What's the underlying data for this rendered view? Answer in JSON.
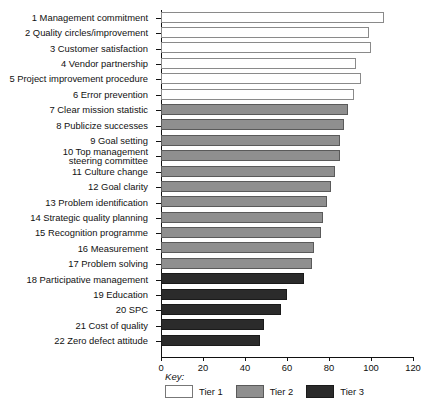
{
  "chart_data": {
    "type": "bar",
    "orientation": "horizontal",
    "title": "",
    "xlabel": "",
    "ylabel": "",
    "xlim": [
      0,
      120
    ],
    "xticks": [
      0,
      20,
      40,
      60,
      80,
      100,
      120
    ],
    "grid": false,
    "categories": [
      "1 Management commitment",
      "2 Quality circles/improvement",
      "3 Customer satisfaction",
      "4 Vendor partnership",
      "5 Project improvement procedure",
      "6 Error prevention",
      "7 Clear mission statistic",
      "8 Publicize successes",
      "9 Goal setting",
      "10 Top management steering committee",
      "11 Culture change",
      "12 Goal clarity",
      "13 Problem identification",
      "14 Strategic quality planning",
      "15 Recognition programme",
      "16 Measurement",
      "17 Problem solving",
      "18 Participative management",
      "19 Education",
      "20 SPC",
      "21 Cost of quality",
      "22 Zero defect attitude"
    ],
    "values": [
      106,
      99,
      100,
      93,
      95,
      92,
      89,
      87,
      85,
      85,
      83,
      81,
      79,
      77,
      76,
      73,
      72,
      68,
      60,
      57,
      49,
      47
    ],
    "series": [
      {
        "name": "Tier 1",
        "color": "#ffffff",
        "items": [
          {
            "label": "1 Management commitment",
            "value": 106
          },
          {
            "label": "2 Quality circles/improvement",
            "value": 99
          },
          {
            "label": "3 Customer satisfaction",
            "value": 100
          },
          {
            "label": "4 Vendor partnership",
            "value": 93
          },
          {
            "label": "5 Project improvement procedure",
            "value": 95
          },
          {
            "label": "6 Error prevention",
            "value": 92
          }
        ]
      },
      {
        "name": "Tier 2",
        "color": "#8f8f8f",
        "items": [
          {
            "label": "7 Clear mission statistic",
            "value": 89
          },
          {
            "label": "8 Publicize successes",
            "value": 87
          },
          {
            "label": "9 Goal setting",
            "value": 85
          },
          {
            "label": "10 Top management steering committee",
            "value": 85
          },
          {
            "label": "11 Culture change",
            "value": 83
          },
          {
            "label": "12 Goal clarity",
            "value": 81
          },
          {
            "label": "13 Problem identification",
            "value": 79
          },
          {
            "label": "14 Strategic quality planning",
            "value": 77
          },
          {
            "label": "15 Recognition programme",
            "value": 76
          },
          {
            "label": "16 Measurement",
            "value": 73
          },
          {
            "label": "17 Problem solving",
            "value": 72
          }
        ]
      },
      {
        "name": "Tier 3",
        "color": "#2b2b2b",
        "items": [
          {
            "label": "18 Participative management",
            "value": 68
          },
          {
            "label": "19 Education",
            "value": 60
          },
          {
            "label": "20 SPC",
            "value": 57
          },
          {
            "label": "21 Cost of quality",
            "value": 49
          },
          {
            "label": "22 Zero defect attitude",
            "value": 47
          }
        ]
      }
    ]
  },
  "bars": [
    {
      "label": "1 Management commitment",
      "label_line1": "1 Management commitment",
      "label_line2": "",
      "value": 106,
      "tier": "t1"
    },
    {
      "label": "2 Quality circles/improvement",
      "label_line1": "2 Quality circles/improvement",
      "label_line2": "",
      "value": 99,
      "tier": "t1"
    },
    {
      "label": "3 Customer satisfaction",
      "label_line1": "3 Customer satisfaction",
      "label_line2": "",
      "value": 100,
      "tier": "t1"
    },
    {
      "label": "4 Vendor partnership",
      "label_line1": "4 Vendor partnership",
      "label_line2": "",
      "value": 93,
      "tier": "t1"
    },
    {
      "label": "5 Project improvement procedure",
      "label_line1": "5 Project improvement procedure",
      "label_line2": "",
      "value": 95,
      "tier": "t1"
    },
    {
      "label": "6 Error prevention",
      "label_line1": "6 Error prevention",
      "label_line2": "",
      "value": 92,
      "tier": "t1"
    },
    {
      "label": "7 Clear mission statistic",
      "label_line1": "7 Clear mission statistic",
      "label_line2": "",
      "value": 89,
      "tier": "t2"
    },
    {
      "label": "8 Publicize successes",
      "label_line1": "8 Publicize successes",
      "label_line2": "",
      "value": 87,
      "tier": "t2"
    },
    {
      "label": "9 Goal setting",
      "label_line1": "9 Goal setting",
      "label_line2": "",
      "value": 85,
      "tier": "t2"
    },
    {
      "label": "10 Top management steering committee",
      "label_line1": "10 Top management",
      "label_line2": "steering committee",
      "value": 85,
      "tier": "t2"
    },
    {
      "label": "11 Culture change",
      "label_line1": "11 Culture change",
      "label_line2": "",
      "value": 83,
      "tier": "t2"
    },
    {
      "label": "12 Goal clarity",
      "label_line1": "12 Goal clarity",
      "label_line2": "",
      "value": 81,
      "tier": "t2"
    },
    {
      "label": "13 Problem identification",
      "label_line1": "13 Problem identification",
      "label_line2": "",
      "value": 79,
      "tier": "t2"
    },
    {
      "label": "14 Strategic quality planning",
      "label_line1": "14 Strategic quality planning",
      "label_line2": "",
      "value": 77,
      "tier": "t2"
    },
    {
      "label": "15 Recognition programme",
      "label_line1": "15 Recognition programme",
      "label_line2": "",
      "value": 76,
      "tier": "t2"
    },
    {
      "label": "16 Measurement",
      "label_line1": "16 Measurement",
      "label_line2": "",
      "value": 73,
      "tier": "t2"
    },
    {
      "label": "17 Problem solving",
      "label_line1": "17 Problem solving",
      "label_line2": "",
      "value": 72,
      "tier": "t2"
    },
    {
      "label": "18 Participative management",
      "label_line1": "18 Participative management",
      "label_line2": "",
      "value": 68,
      "tier": "t3"
    },
    {
      "label": "19 Education",
      "label_line1": "19 Education",
      "label_line2": "",
      "value": 60,
      "tier": "t3"
    },
    {
      "label": "20 SPC",
      "label_line1": "20 SPC",
      "label_line2": "",
      "value": 57,
      "tier": "t3"
    },
    {
      "label": "21 Cost of quality",
      "label_line1": "21 Cost of quality",
      "label_line2": "",
      "value": 49,
      "tier": "t3"
    },
    {
      "label": "22 Zero defect attitude",
      "label_line1": "22 Zero defect attitude",
      "label_line2": "",
      "value": 47,
      "tier": "t3"
    }
  ],
  "axis": {
    "ticks": [
      "0",
      "20",
      "40",
      "60",
      "80",
      "100",
      "120"
    ],
    "min": 0,
    "max": 120
  },
  "legend": {
    "title": "Key:",
    "entries": [
      {
        "label": "Tier 1",
        "tier": "t1",
        "color": "#ffffff"
      },
      {
        "label": "Tier 2",
        "tier": "t2",
        "color": "#8f8f8f"
      },
      {
        "label": "Tier 3",
        "tier": "t3",
        "color": "#2b2b2b"
      }
    ]
  }
}
